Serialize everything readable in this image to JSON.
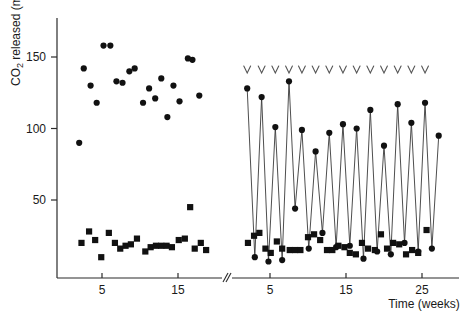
{
  "figure": {
    "background": "#ffffff",
    "marker_color": "#111111",
    "line_color": "#3a3a3a",
    "axis_color": "#2b2b2b",
    "arrow_color": "#555555"
  },
  "axis_labels": {
    "y_title_main": "CO",
    "y_title_sub": "2",
    "y_title_rest": " released (mg)",
    "x_title": "Time (weeks)"
  },
  "ticks": {
    "y": [
      "50",
      "100",
      "150"
    ],
    "x_left": [
      "5",
      "15"
    ],
    "x_right": [
      "5",
      "15",
      "25"
    ]
  },
  "chart_data": {
    "type": "scatter",
    "title": "",
    "xlabel": "Time (weeks)",
    "ylabel": "CO2 released (mg)",
    "ylim": [
      0,
      175
    ],
    "grid": false,
    "legend": "none",
    "panels": [
      {
        "name": "left-panel",
        "xlim": [
          1,
          19
        ],
        "xticks": [
          5,
          15
        ],
        "series": [
          {
            "name": "control-co2-circles",
            "marker": "circle",
            "connected": false,
            "points": [
              [
                2.0,
                90
              ],
              [
                2.6,
                142
              ],
              [
                3.5,
                130
              ],
              [
                4.3,
                118
              ],
              [
                5.2,
                158
              ],
              [
                6.1,
                158
              ],
              [
                6.9,
                133
              ],
              [
                7.7,
                132
              ],
              [
                8.6,
                140
              ],
              [
                9.3,
                142
              ],
              [
                10.4,
                118
              ],
              [
                11.2,
                128
              ],
              [
                12.0,
                121
              ],
              [
                12.8,
                135
              ],
              [
                13.6,
                108
              ],
              [
                14.4,
                130
              ],
              [
                15.2,
                119
              ],
              [
                16.3,
                149
              ],
              [
                16.9,
                148
              ],
              [
                17.8,
                123
              ]
            ]
          },
          {
            "name": "control-co2-squares",
            "marker": "square",
            "connected": false,
            "points": [
              [
                2.3,
                20
              ],
              [
                3.3,
                28
              ],
              [
                4.1,
                22
              ],
              [
                4.9,
                10
              ],
              [
                5.9,
                27
              ],
              [
                6.7,
                20
              ],
              [
                7.4,
                16
              ],
              [
                8.1,
                18
              ],
              [
                8.8,
                19
              ],
              [
                9.6,
                23
              ],
              [
                10.7,
                14
              ],
              [
                11.4,
                17
              ],
              [
                12.1,
                18
              ],
              [
                12.8,
                18
              ],
              [
                13.5,
                18
              ],
              [
                14.2,
                17
              ],
              [
                15.1,
                22
              ],
              [
                15.9,
                23
              ],
              [
                16.6,
                45
              ],
              [
                17.2,
                16
              ],
              [
                18.0,
                20
              ],
              [
                18.7,
                15
              ]
            ]
          }
        ]
      },
      {
        "name": "right-panel",
        "xlim": [
          1,
          29
        ],
        "xticks": [
          5,
          15,
          25
        ],
        "series": [
          {
            "name": "treated-co2-circles-zigzag",
            "marker": "circle",
            "connected": true,
            "points": [
              [
                2.0,
                128
              ],
              [
                3.0,
                10
              ],
              [
                3.9,
                122
              ],
              [
                4.8,
                7
              ],
              [
                5.7,
                101
              ],
              [
                6.6,
                8
              ],
              [
                7.5,
                133
              ],
              [
                8.3,
                44
              ],
              [
                9.2,
                99
              ],
              [
                10.1,
                16
              ],
              [
                11.0,
                84
              ],
              [
                11.9,
                27
              ],
              [
                12.8,
                97
              ],
              [
                13.7,
                17
              ],
              [
                14.6,
                103
              ],
              [
                15.5,
                18
              ],
              [
                16.4,
                100
              ],
              [
                17.3,
                9
              ],
              [
                18.2,
                113
              ],
              [
                19.1,
                14
              ],
              [
                20.0,
                88
              ],
              [
                20.9,
                12
              ],
              [
                21.8,
                117
              ],
              [
                22.7,
                20
              ],
              [
                23.6,
                104
              ],
              [
                24.5,
                14
              ],
              [
                25.4,
                118
              ],
              [
                26.3,
                16
              ],
              [
                27.2,
                95
              ]
            ]
          },
          {
            "name": "treated-co2-squares",
            "marker": "square",
            "connected": false,
            "points": [
              [
                2.1,
                20
              ],
              [
                2.9,
                25
              ],
              [
                3.6,
                27
              ],
              [
                4.4,
                16
              ],
              [
                5.1,
                13
              ],
              [
                5.9,
                21
              ],
              [
                6.6,
                16
              ],
              [
                7.6,
                15
              ],
              [
                8.3,
                15
              ],
              [
                9.0,
                15
              ],
              [
                10.0,
                24
              ],
              [
                10.8,
                26
              ],
              [
                11.6,
                22
              ],
              [
                12.5,
                15
              ],
              [
                13.2,
                15
              ],
              [
                14.0,
                18
              ],
              [
                14.8,
                17
              ],
              [
                15.5,
                13
              ],
              [
                16.3,
                12
              ],
              [
                17.1,
                20
              ],
              [
                17.9,
                16
              ],
              [
                18.8,
                15
              ],
              [
                19.6,
                26
              ],
              [
                20.4,
                16
              ],
              [
                21.2,
                20
              ],
              [
                22.0,
                19
              ],
              [
                22.9,
                12
              ],
              [
                23.7,
                15
              ],
              [
                24.5,
                13
              ],
              [
                25.6,
                29
              ]
            ]
          }
        ],
        "annotations": {
          "name": "addition-arrows",
          "glyph": "v",
          "count": 14,
          "weeks": [
            2.0,
            3.9,
            5.7,
            7.5,
            9.2,
            11.0,
            12.8,
            14.6,
            16.4,
            18.2,
            20.0,
            21.8,
            23.6,
            25.4
          ]
        }
      }
    ],
    "axis_break": {
      "present": true,
      "x_px": 227
    }
  }
}
